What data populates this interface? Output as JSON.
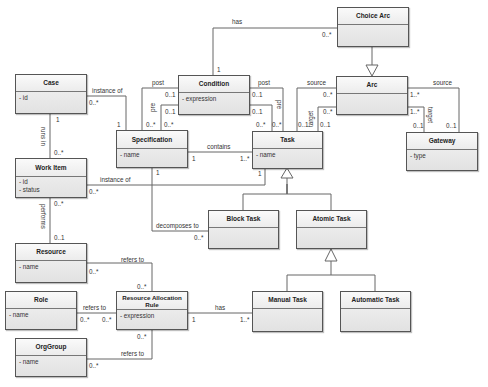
{
  "diagram": {
    "type": "UML class diagram",
    "classes": {
      "choice_arc": {
        "name": "Choice Arc",
        "attributes": []
      },
      "case": {
        "name": "Case",
        "attributes": [
          "- id"
        ]
      },
      "condition": {
        "name": "Condition",
        "attributes": [
          "- expression"
        ]
      },
      "arc": {
        "name": "Arc",
        "attributes": []
      },
      "specification": {
        "name": "Specification",
        "attributes": [
          "- name"
        ]
      },
      "task": {
        "name": "Task",
        "attributes": [
          "- name"
        ]
      },
      "gateway": {
        "name": "Gateway",
        "attributes": [
          "- type"
        ]
      },
      "work_item": {
        "name": "Work Item",
        "attributes": [
          "- id",
          "- status"
        ]
      },
      "block_task": {
        "name": "Block Task",
        "attributes": []
      },
      "atomic_task": {
        "name": "Atomic Task",
        "attributes": []
      },
      "resource": {
        "name": "Resource",
        "attributes": [
          "- name"
        ]
      },
      "role": {
        "name": "Role",
        "attributes": [
          "- name"
        ]
      },
      "rar": {
        "name": "Resource Allocation Rule",
        "attributes": [
          "- expression"
        ]
      },
      "manual_task": {
        "name": "Manual Task",
        "attributes": []
      },
      "automatic_task": {
        "name": "Automatic Task",
        "attributes": []
      },
      "orggroup": {
        "name": "OrgGroup",
        "attributes": [
          "- name"
        ]
      }
    },
    "associations": {
      "has_choice": {
        "label": "has",
        "m1": "1",
        "m2": "0..*"
      },
      "case_spec": {
        "label": "instance of",
        "m1": "0..*",
        "m2": "1"
      },
      "spec_cond_post": {
        "label": "post",
        "m1": "0..*",
        "m2": "0..1"
      },
      "spec_cond_pre": {
        "label": "pre",
        "m1": "0..*",
        "m2": "0..1"
      },
      "task_cond_post": {
        "label": "post",
        "m1": "0..*",
        "m2": "0..1"
      },
      "task_cond_pre": {
        "label": "pre",
        "m1": "0..*",
        "m2": "0..1"
      },
      "task_arc_source": {
        "label": "source",
        "m1": "0..1",
        "m2": "0..*"
      },
      "task_arc_target": {
        "label": "target",
        "m1": "0..1",
        "m2": "0..*"
      },
      "gw_arc_source": {
        "label": "source",
        "m1": "0..1",
        "m2": "1..*"
      },
      "gw_arc_target": {
        "label": "target",
        "m1": "0..1",
        "m2": "1..*"
      },
      "spec_task": {
        "label": "contains",
        "m1": "1",
        "m2": "1..*"
      },
      "case_wi": {
        "label": "runs in",
        "m1": "1",
        "m2": "0..*"
      },
      "wi_task": {
        "label": "instance of",
        "m1": "0..*",
        "m2": "1"
      },
      "spec_block": {
        "label": "decomposes to",
        "m1": "1",
        "m2": "0..*"
      },
      "wi_res": {
        "label": "performs",
        "m1": "0..*",
        "m2": "0..1"
      },
      "res_rar": {
        "label": "refers to",
        "m1": "0..*",
        "m2": "0..*"
      },
      "role_rar": {
        "label": "refers to",
        "m1": "0..*",
        "m2": "0..*"
      },
      "org_rar": {
        "label": "refers to",
        "m1": "0..*",
        "m2": "0..*"
      },
      "rar_manual": {
        "label": "has",
        "m1": "1",
        "m2": "1..*"
      }
    },
    "generalizations": [
      {
        "parent": "Arc",
        "child": "Choice Arc"
      },
      {
        "parent": "Task",
        "children": [
          "Block Task",
          "Atomic Task"
        ]
      },
      {
        "parent": "Atomic Task",
        "children": [
          "Manual Task",
          "Automatic Task"
        ]
      }
    ],
    "colors": {
      "line": "#555555",
      "box_fill": "#e8e8e8",
      "text": "#222222"
    }
  }
}
